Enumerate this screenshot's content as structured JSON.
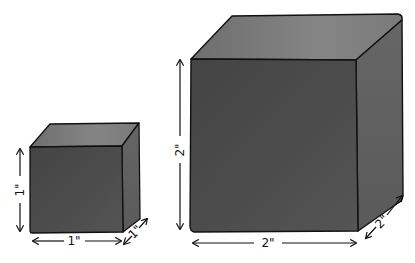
{
  "illustration": {
    "description": "Hand-drawn comparison of two cubes",
    "colors": {
      "background": "#ffffff",
      "outline": "#111111",
      "front_face": "#4a4a4a",
      "top_face": "#7a7a7a",
      "side_face": "#5e5e5e"
    },
    "small_cube": {
      "height_label": "1\"",
      "width_label": "1\"",
      "depth_label": "1\""
    },
    "large_cube": {
      "height_label": "2\"",
      "width_label": "2\"",
      "depth_label": "2\""
    }
  }
}
